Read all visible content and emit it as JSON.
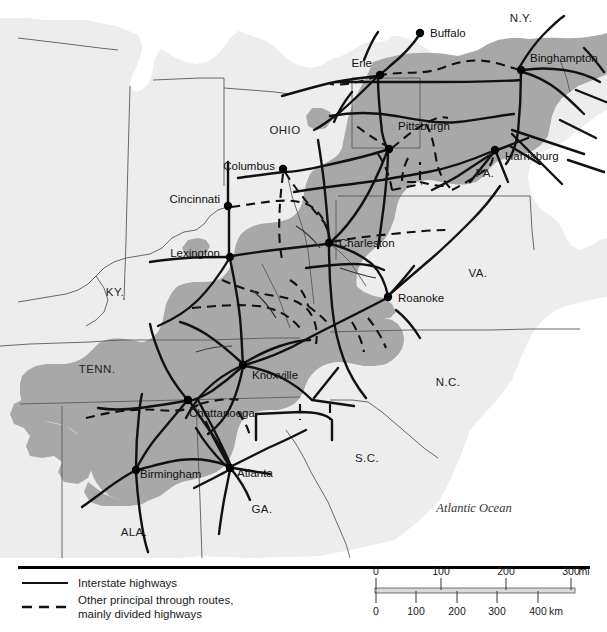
{
  "figure": {
    "type": "reference-map",
    "width": 607,
    "height": 632
  },
  "colors": {
    "ocean": "#ffffff",
    "land": "#ededed",
    "highlight_region": "#a8a8a8",
    "lake": "#ffffff",
    "route_line": "#111111",
    "border_line": "#555555",
    "text": "#111111",
    "scale_bar": "#d9d9d9",
    "rule": "#000000"
  },
  "map": {
    "cities": [
      {
        "name": "Buffalo",
        "x": 420,
        "y": 33,
        "label_x": 430,
        "label_y": 37,
        "anchor": "start"
      },
      {
        "name": "Erie",
        "x": 380,
        "y": 75,
        "label_x": 372,
        "label_y": 67,
        "anchor": "end"
      },
      {
        "name": "Binghampton",
        "x": 521,
        "y": 70,
        "label_x": 530,
        "label_y": 62,
        "anchor": "start"
      },
      {
        "name": "Pittsburgh",
        "x": 389,
        "y": 149,
        "label_x": 398,
        "label_y": 130,
        "anchor": "start"
      },
      {
        "name": "Harrisburg",
        "x": 495,
        "y": 150,
        "label_x": 505,
        "label_y": 160,
        "anchor": "start"
      },
      {
        "name": "Columbus",
        "x": 283,
        "y": 169,
        "label_x": 275,
        "label_y": 170,
        "anchor": "end"
      },
      {
        "name": "Cincinnati",
        "x": 228,
        "y": 206,
        "label_x": 220,
        "label_y": 203,
        "anchor": "end"
      },
      {
        "name": "Charleston",
        "x": 329,
        "y": 243,
        "label_x": 339,
        "label_y": 247,
        "anchor": "start"
      },
      {
        "name": "Lexington",
        "x": 230,
        "y": 257,
        "label_x": 220,
        "label_y": 257,
        "anchor": "end"
      },
      {
        "name": "Roanoke",
        "x": 388,
        "y": 297,
        "label_x": 398,
        "label_y": 302,
        "anchor": "start"
      },
      {
        "name": "Knoxville",
        "x": 243,
        "y": 365,
        "label_x": 252,
        "label_y": 379,
        "anchor": "start"
      },
      {
        "name": "Chattanooga",
        "x": 188,
        "y": 400,
        "label_x": 189,
        "label_y": 417,
        "anchor": "start"
      },
      {
        "name": "Birmingham",
        "x": 136,
        "y": 470,
        "label_x": 140,
        "label_y": 478,
        "anchor": "start"
      },
      {
        "name": "Atlanta",
        "x": 230,
        "y": 468,
        "label_x": 237,
        "label_y": 477,
        "anchor": "start"
      }
    ],
    "states": [
      {
        "name": "N.Y.",
        "x": 521,
        "y": 22
      },
      {
        "name": "OHIO",
        "x": 285,
        "y": 134
      },
      {
        "name": "PA.",
        "x": 485,
        "y": 177
      },
      {
        "name": "VA.",
        "x": 478,
        "y": 277
      },
      {
        "name": "KY.",
        "x": 115,
        "y": 296
      },
      {
        "name": "TENN.",
        "x": 97,
        "y": 373
      },
      {
        "name": "N.C.",
        "x": 448,
        "y": 386
      },
      {
        "name": "S.C.",
        "x": 367,
        "y": 462
      },
      {
        "name": "GA.",
        "x": 262,
        "y": 513
      },
      {
        "name": "ALA.",
        "x": 134,
        "y": 536
      }
    ],
    "water_labels": [
      {
        "name": "Atlantic Ocean",
        "x": 474,
        "y": 512
      }
    ]
  },
  "legend": {
    "items": [
      {
        "style": "solid",
        "label": "Interstate highways"
      },
      {
        "style": "dashed",
        "label": "Other principal through routes,",
        "label2": "mainly divided highways"
      }
    ]
  },
  "scale": {
    "miles": {
      "ticks": [
        "0",
        "100",
        "200",
        "300"
      ],
      "unit": "mi"
    },
    "kilometers": {
      "ticks": [
        "0",
        "100",
        "200",
        "300",
        "400"
      ],
      "unit": "km"
    }
  }
}
